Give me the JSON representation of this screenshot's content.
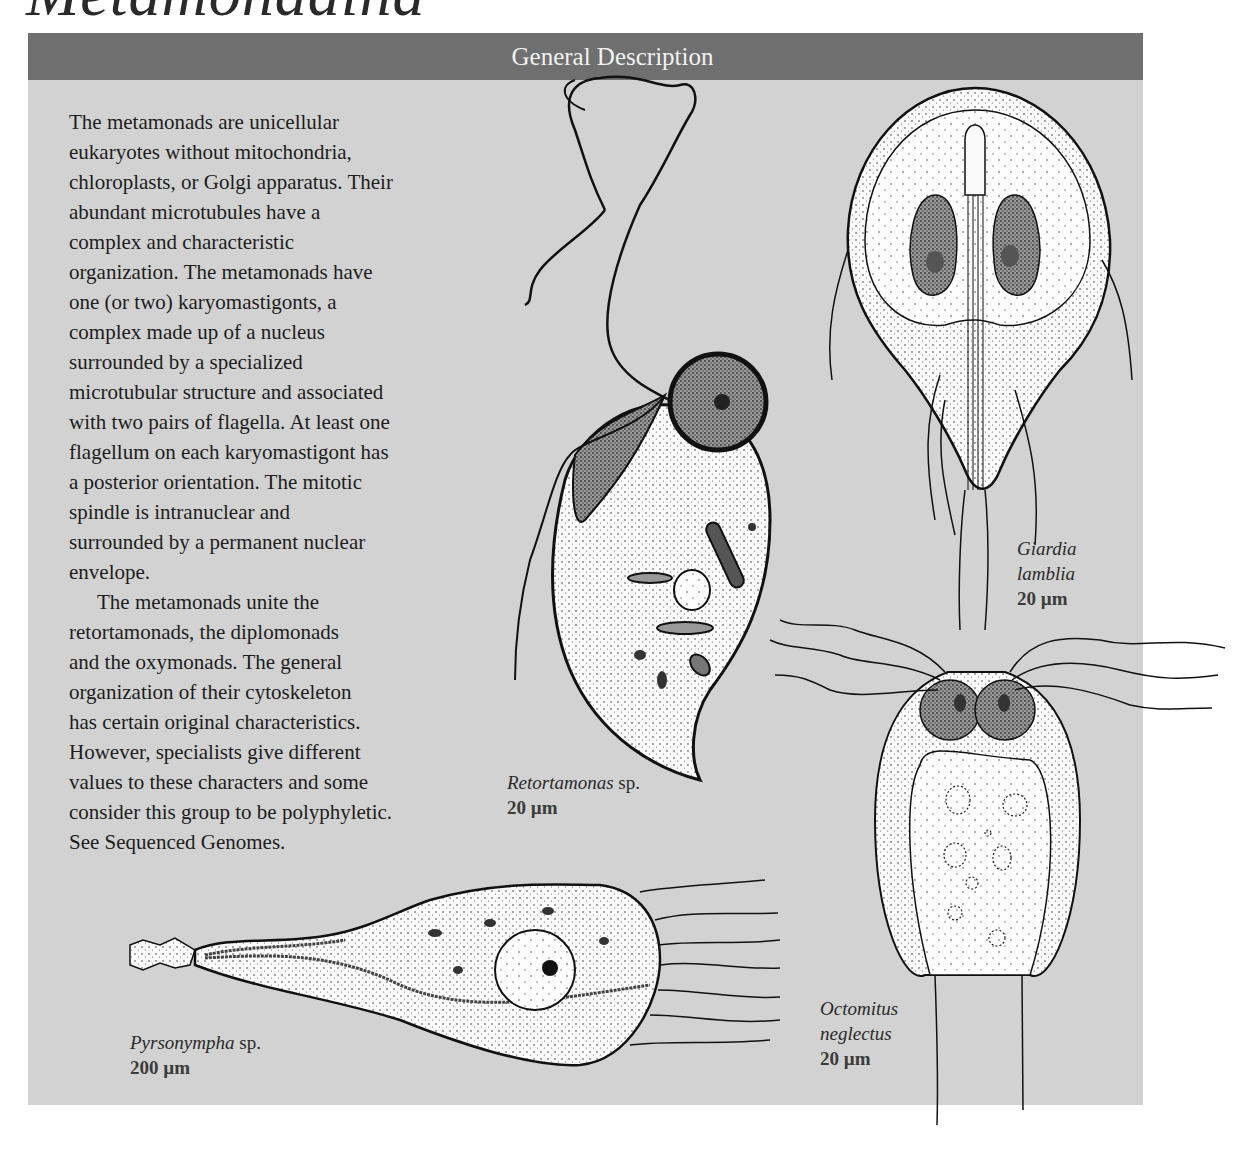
{
  "page": {
    "title": "Metamonadina"
  },
  "panel": {
    "header": "General Description",
    "colors": {
      "header_bg": "#6f6f6f",
      "panel_bg": "#d2d2d2",
      "header_text": "#f2f2f2"
    },
    "paragraphs": [
      {
        "lines": [
          "The metamonads are unicellular",
          "eukaryotes without mitochondria,",
          "chloroplasts, or Golgi apparatus. Their",
          "abundant microtubules have a",
          "complex and characteristic",
          "organization. The metamonads have",
          "one (or two) karyomastigonts, a",
          "complex made up of a nucleus",
          "surrounded by a specialized",
          "microtubular structure and associated",
          "with two pairs of flagella. At least one",
          "flagellum on each karyomastigont has",
          "a posterior orientation. The mitotic",
          "spindle is intranuclear and",
          "surrounded by a permanent nuclear",
          "envelope."
        ]
      },
      {
        "lines": [
          "The metamonads unite the",
          "retortamonads, the diplomonads",
          "and the oxymonads. The general",
          "organization of their cytoskeleton",
          "has certain original characteristics.",
          "However, specialists give different",
          "values to these characters and some",
          "consider this group to be polyphyletic.",
          "See Sequenced Genomes."
        ]
      }
    ]
  },
  "figures": [
    {
      "id": "retortamonas",
      "species": "Retortamonas",
      "suffix": " sp.",
      "scale": "20 µm"
    },
    {
      "id": "giardia",
      "species_line1": "Giardia",
      "species_line2": "lamblia",
      "scale": "20 µm"
    },
    {
      "id": "octomitus",
      "species_line1": "Octomitus",
      "species_line2": "neglectus",
      "scale": "20 µm"
    },
    {
      "id": "pyrsonympha",
      "species": "Pyrsonympha",
      "suffix": " sp.",
      "scale": "200 µm"
    }
  ]
}
